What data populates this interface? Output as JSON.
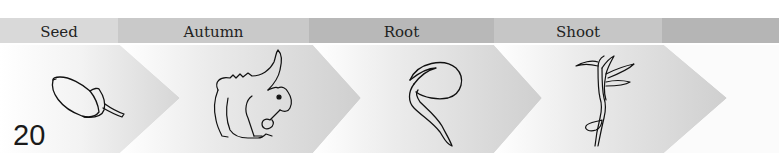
{
  "diagram": {
    "stages": [
      {
        "label": "Seed",
        "illustration": "acorn",
        "band_color": "#d9d9d9"
      },
      {
        "label": "Autumn",
        "illustration": "squirrel",
        "band_color": "#c9c9c9"
      },
      {
        "label": "Root",
        "illustration": "germinating-acorn",
        "band_color": "#b8b8b8"
      },
      {
        "label": "Shoot",
        "illustration": "seedling",
        "band_color": "#c6c6c6"
      },
      {
        "label": "",
        "illustration": "",
        "band_color": "#b5b5b5"
      }
    ],
    "chevron_color": "#d3d3d3"
  },
  "page": {
    "number": "20"
  }
}
